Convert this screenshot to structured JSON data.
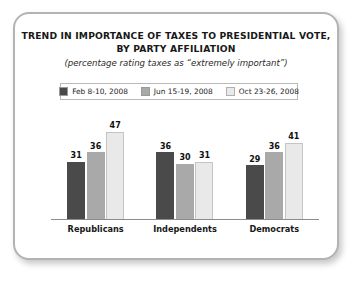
{
  "card": {
    "title_lines": [
      "TREND IN IMPORTANCE OF TAXES TO PRESIDENTIAL VOTE,",
      "BY PARTY AFFILIATION"
    ],
    "subtitle": "(percentage rating taxes as “extremely important”)"
  },
  "colors": {
    "series_1": "#4a4a4a",
    "series_2": "#a9a9a9",
    "series_3": "#e9e9e9",
    "axis": "#8c8c8c",
    "border": "#b3b3b3",
    "text": "#181818"
  },
  "chart_data": {
    "type": "bar",
    "title": "TREND IN IMPORTANCE OF TAXES TO PRESIDENTIAL VOTE, BY PARTY AFFILIATION",
    "subtitle": "(percentage rating taxes as “extremely important”)",
    "xlabel": "",
    "ylabel": "",
    "ylim": [
      0,
      50
    ],
    "grid": false,
    "legend_position": "top",
    "categories": [
      "Republicans",
      "Independents",
      "Democrats"
    ],
    "series": [
      {
        "name": "Feb 8-10, 2008",
        "color": "#4a4a4a",
        "values": [
          31,
          36,
          29
        ]
      },
      {
        "name": "Jun 15-19, 2008",
        "color": "#a9a9a9",
        "values": [
          36,
          30,
          36
        ]
      },
      {
        "name": "Oct 23-26, 2008",
        "color": "#e9e9e9",
        "values": [
          47,
          31,
          41
        ]
      }
    ]
  }
}
